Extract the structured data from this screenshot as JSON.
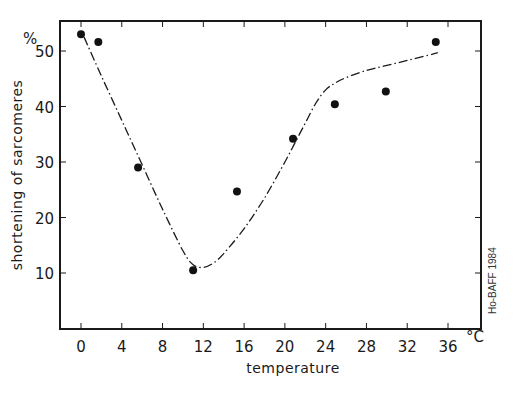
{
  "chart_data": {
    "type": "scatter",
    "title": "",
    "xlabel": "temperature",
    "ylabel": "shortening of sarcomeres",
    "x_unit": "°C",
    "y_unit": "%",
    "xlim": [
      -2,
      38.5
    ],
    "ylim": [
      0,
      55
    ],
    "x_ticks": [
      0,
      4,
      8,
      12,
      16,
      20,
      24,
      28,
      32,
      36
    ],
    "x_tick_labels": [
      "0",
      "4",
      "8",
      "12",
      "16",
      "20",
      "24",
      "28",
      "32",
      "36"
    ],
    "y_ticks": [
      10,
      20,
      30,
      40,
      50
    ],
    "y_tick_labels": [
      "10",
      "20",
      "30",
      "40",
      "50"
    ],
    "grid": false,
    "legend": null,
    "series": [
      {
        "name": "measurements",
        "style": "filled-circle-markers",
        "x": [
          0,
          1.7,
          5.6,
          11.0,
          15.3,
          20.8,
          24.9,
          29.9,
          34.8
        ],
        "y": [
          53.0,
          51.6,
          29.0,
          10.5,
          24.7,
          34.2,
          40.4,
          42.7,
          51.6
        ]
      },
      {
        "name": "fitted curve",
        "style": "dash-dot-line",
        "x": [
          0.3,
          2,
          4,
          6,
          8,
          10,
          11,
          12,
          13,
          14,
          16,
          18,
          20,
          21,
          22,
          23,
          24,
          25,
          26,
          28,
          30,
          32,
          34,
          35
        ],
        "y": [
          52.5,
          45.5,
          37.5,
          29.5,
          21.5,
          14.0,
          11.5,
          11.0,
          11.8,
          13.5,
          18.0,
          23.5,
          30.0,
          33.5,
          37.0,
          40.5,
          43.0,
          44.3,
          45.2,
          46.5,
          47.4,
          48.3,
          49.2,
          49.7
        ]
      }
    ],
    "annotations": [
      "Ho-BAFF 1984"
    ]
  },
  "labels": {
    "y_unit": "%",
    "x_unit": "°C",
    "credit": "Ho-BAFF 1984"
  }
}
